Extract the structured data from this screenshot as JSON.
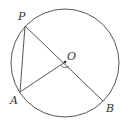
{
  "diagram": {
    "type": "circle-geometry",
    "stroke_color": "#555555",
    "circle": {
      "center_label": "O",
      "cx": 65,
      "cy": 63,
      "r": 54
    },
    "points": {
      "P": {
        "label": "P",
        "x": 25,
        "y": 26
      },
      "O": {
        "label": "O",
        "x": 65,
        "y": 62
      },
      "A": {
        "label": "A",
        "x": 20,
        "y": 92
      },
      "B": {
        "label": "B",
        "x": 103,
        "y": 101
      }
    },
    "segments": [
      "PA",
      "PB",
      "AO"
    ],
    "angle_marker": "angle AOB at O",
    "labels": {
      "P": "P",
      "O": "O",
      "A": "A",
      "B": "B"
    }
  }
}
